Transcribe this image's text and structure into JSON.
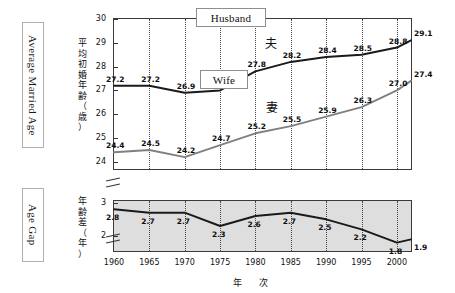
{
  "side_labels": {
    "upper": "Average Married Age",
    "lower": "Age Gap"
  },
  "axis_captions": {
    "upper_jp": "平均初婚年齢（歳）",
    "lower_jp": "年齢差（年）",
    "x_jp": "年　次"
  },
  "callouts": {
    "husband": "Husband",
    "wife": "Wife"
  },
  "series_kanji": {
    "husband": "夫",
    "wife": "妻"
  },
  "ticks": {
    "upper_y": [
      "30",
      "29",
      "28",
      "27",
      "26",
      "25",
      "24"
    ],
    "lower_y": [
      "3",
      "2"
    ],
    "x": [
      "1960",
      "1965",
      "1970",
      "1975",
      "1980",
      "1985",
      "1990",
      "1995",
      "2000"
    ]
  },
  "colors": {
    "husband_line": "#1a1a1a",
    "wife_line": "#808080",
    "frame": "#3a3a3a",
    "grid": "#444444",
    "lower_panel_fill": "#dedede"
  },
  "chart_data": [
    {
      "type": "line",
      "title": "Average Married Age",
      "xlabel": "年　次",
      "ylabel": "平均初婚年齢（歳）",
      "xlim": [
        1960,
        2002
      ],
      "ylim": [
        23.7,
        30
      ],
      "grid": true,
      "legend": [
        "Husband",
        "Wife"
      ],
      "x": [
        1960,
        1965,
        1970,
        1975,
        1980,
        1985,
        1990,
        1995,
        2000,
        2002
      ],
      "series": [
        {
          "name": "Husband",
          "name_jp": "夫",
          "values": [
            27.2,
            27.2,
            26.9,
            27.0,
            27.8,
            28.2,
            28.4,
            28.5,
            28.8,
            29.1
          ],
          "labels": [
            {
              "x": 1960,
              "value": 27.2
            },
            {
              "x": 1965,
              "value": 27.2
            },
            {
              "x": 1970,
              "value": 26.9
            },
            {
              "x": 1980,
              "value": 27.8
            },
            {
              "x": 1985,
              "value": 28.2
            },
            {
              "x": 1990,
              "value": 28.4
            },
            {
              "x": 1995,
              "value": 28.5
            },
            {
              "x": 2000,
              "value": 28.8
            },
            {
              "x": 2002,
              "value": 29.1
            }
          ]
        },
        {
          "name": "Wife",
          "name_jp": "妻",
          "values": [
            24.4,
            24.5,
            24.2,
            24.7,
            25.2,
            25.5,
            25.9,
            26.3,
            27.0,
            27.4
          ],
          "labels": [
            {
              "x": 1960,
              "value": 24.4
            },
            {
              "x": 1965,
              "value": 24.5
            },
            {
              "x": 1970,
              "value": 24.2
            },
            {
              "x": 1975,
              "value": 24.7
            },
            {
              "x": 1980,
              "value": 25.2
            },
            {
              "x": 1985,
              "value": 25.5
            },
            {
              "x": 1990,
              "value": 25.9
            },
            {
              "x": 1995,
              "value": 26.3
            },
            {
              "x": 2000,
              "value": 27.0
            },
            {
              "x": 2002,
              "value": 27.4
            }
          ]
        }
      ]
    },
    {
      "type": "line",
      "title": "Age Gap",
      "xlabel": "年　次",
      "ylabel": "年齢差（年）",
      "xlim": [
        1960,
        2002
      ],
      "ylim": [
        1.55,
        3.05
      ],
      "grid": true,
      "x": [
        1960,
        1965,
        1970,
        1975,
        1980,
        1985,
        1990,
        1995,
        2000,
        2002
      ],
      "series": [
        {
          "name": "Age Gap",
          "values": [
            2.8,
            2.7,
            2.7,
            2.3,
            2.6,
            2.7,
            2.5,
            2.2,
            1.8,
            1.9
          ],
          "labels": [
            {
              "x": 1960,
              "value": 2.8
            },
            {
              "x": 1965,
              "value": 2.7
            },
            {
              "x": 1970,
              "value": 2.7
            },
            {
              "x": 1975,
              "value": 2.3
            },
            {
              "x": 1980,
              "value": 2.6
            },
            {
              "x": 1985,
              "value": 2.7
            },
            {
              "x": 1990,
              "value": 2.5
            },
            {
              "x": 1995,
              "value": 2.2
            },
            {
              "x": 2000,
              "value": 1.8
            },
            {
              "x": 2002,
              "value": 1.9
            }
          ]
        }
      ]
    }
  ]
}
